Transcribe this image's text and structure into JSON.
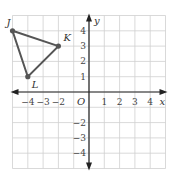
{
  "graph": {
    "x_axis_label": "x",
    "y_axis_label": "y",
    "origin_label": "O",
    "x_ticks": [
      {
        "value": -4,
        "label": "−4"
      },
      {
        "value": -3,
        "label": "−3"
      },
      {
        "value": -2,
        "label": "−2"
      },
      {
        "value": 1,
        "label": "1"
      },
      {
        "value": 2,
        "label": "2"
      },
      {
        "value": 3,
        "label": "3"
      },
      {
        "value": 4,
        "label": "4"
      }
    ],
    "y_ticks": [
      {
        "value": 4,
        "label": "4"
      },
      {
        "value": 3,
        "label": "3"
      },
      {
        "value": 2,
        "label": "2"
      },
      {
        "value": 1,
        "label": "1"
      },
      {
        "value": -2,
        "label": "−2"
      },
      {
        "value": -3,
        "label": "−3"
      },
      {
        "value": -4,
        "label": "−4"
      }
    ],
    "range": {
      "xmin": -5,
      "xmax": 5,
      "ymin": -5,
      "ymax": 5
    },
    "triangle": {
      "color": "#555555",
      "vertices": [
        {
          "name": "J",
          "x": -5,
          "y": 4
        },
        {
          "name": "K",
          "x": -2,
          "y": 3
        },
        {
          "name": "L",
          "x": -4,
          "y": 1
        }
      ]
    }
  }
}
